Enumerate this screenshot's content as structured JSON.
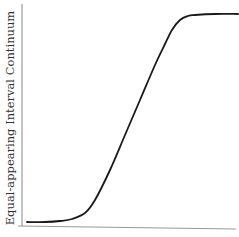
{
  "chart_data": {
    "type": "line",
    "title": "",
    "xlabel": "",
    "ylabel": "Equal-appearing Interval Continuum",
    "grid": false,
    "legend": "none",
    "axes_pixels": {
      "y_axis": {
        "x": 22,
        "y_top": 4,
        "y_bottom": 226
      },
      "x_axis": {
        "x_left": 18,
        "y_left": 226,
        "x_right": 236,
        "y_right": 229
      }
    },
    "series": [
      {
        "name": "curve",
        "points_px": [
          [
            27,
            222
          ],
          [
            45,
            222
          ],
          [
            60,
            221
          ],
          [
            72,
            219
          ],
          [
            85,
            213
          ],
          [
            95,
            200
          ],
          [
            110,
            170
          ],
          [
            125,
            135
          ],
          [
            140,
            100
          ],
          [
            155,
            65
          ],
          [
            165,
            44
          ],
          [
            172,
            30
          ],
          [
            180,
            20
          ],
          [
            188,
            16
          ],
          [
            195,
            15
          ],
          [
            215,
            14
          ],
          [
            238,
            14
          ]
        ]
      }
    ]
  },
  "colors": {
    "curve": "#1a1a1a",
    "axis": "#888888",
    "label": "#333333",
    "background": "#ffffff"
  }
}
